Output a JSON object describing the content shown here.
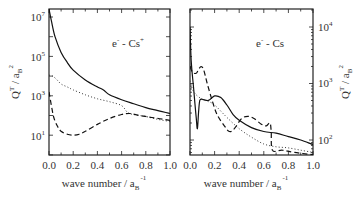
{
  "chart_data": [
    {
      "type": "line",
      "title": "e⁻ - Cs⁺",
      "annotation": "e- - Cs+",
      "xlabel": "wave number / a_B^-1",
      "ylabel": "Q^T / a_B^2",
      "yscale": "log",
      "xlim": [
        0.0,
        1.0
      ],
      "ylim": [
        1,
        25000000
      ],
      "x_ticks": [
        "0.0",
        "0.2",
        "0.4",
        "0.6",
        "0.8",
        "1.0"
      ],
      "y_ticks": [
        "10^1",
        "10^3",
        "10^5",
        "10^7"
      ],
      "y_axis_side": "left",
      "legend": "none",
      "series": [
        {
          "name": "solid",
          "style": "solid",
          "x": [
            0.0,
            0.02,
            0.05,
            0.1,
            0.15,
            0.2,
            0.3,
            0.4,
            0.45,
            0.5,
            0.6,
            0.7,
            0.8,
            0.9,
            1.0
          ],
          "log10_y": [
            7.4,
            6.8,
            6.0,
            5.2,
            4.7,
            4.3,
            3.8,
            3.45,
            3.3,
            3.05,
            2.8,
            2.6,
            2.4,
            2.25,
            2.1
          ]
        },
        {
          "name": "dotted",
          "style": "dotted",
          "x": [
            0.0,
            0.03,
            0.06,
            0.1,
            0.15,
            0.2,
            0.3,
            0.4,
            0.5,
            0.6,
            0.65,
            0.7,
            0.8,
            0.9,
            1.0
          ],
          "log10_y": [
            4.05,
            4.0,
            3.85,
            3.6,
            3.45,
            3.3,
            3.05,
            2.85,
            2.7,
            2.5,
            2.15,
            2.05,
            1.95,
            1.8,
            1.7
          ]
        },
        {
          "name": "dashed",
          "style": "dashed",
          "x": [
            0.0,
            0.02,
            0.04,
            0.07,
            0.1,
            0.15,
            0.2,
            0.25,
            0.3,
            0.4,
            0.5,
            0.6,
            0.67,
            0.75,
            0.85,
            1.0
          ],
          "log10_y": [
            3.2,
            2.5,
            1.9,
            1.45,
            1.2,
            1.05,
            1.0,
            1.05,
            1.2,
            1.55,
            1.85,
            2.05,
            2.1,
            2.0,
            1.9,
            1.75
          ]
        }
      ]
    },
    {
      "type": "line",
      "title": "e⁻ - Cs",
      "annotation": "e- - Cs",
      "xlabel": "wave number / a_B^-1",
      "ylabel": "Q^T / a_B^2",
      "yscale": "log",
      "xlim": [
        0.0,
        1.0
      ],
      "ylim": [
        55,
        20000
      ],
      "x_ticks": [
        "0.0",
        "0.2",
        "0.4",
        "0.6",
        "0.8",
        "1.0"
      ],
      "y_ticks": [
        "10^2",
        "10^3",
        "10^4"
      ],
      "y_axis_side": "right",
      "legend": "none",
      "series": [
        {
          "name": "solid",
          "style": "solid",
          "x": [
            0.0,
            0.01,
            0.03,
            0.05,
            0.06,
            0.07,
            0.08,
            0.1,
            0.15,
            0.2,
            0.25,
            0.3,
            0.35,
            0.4,
            0.5,
            0.6,
            0.7,
            0.8,
            0.9,
            1.0
          ],
          "log10_y": [
            4.0,
            3.4,
            2.9,
            2.4,
            2.2,
            2.5,
            2.7,
            2.72,
            2.7,
            2.78,
            2.75,
            2.62,
            2.45,
            2.35,
            2.22,
            2.15,
            2.12,
            2.06,
            2.0,
            1.92
          ]
        },
        {
          "name": "dotted",
          "style": "dotted",
          "x": [
            0.0,
            0.02,
            0.05,
            0.1,
            0.15,
            0.2,
            0.3,
            0.4,
            0.5,
            0.6,
            0.7,
            0.8,
            0.9,
            1.0
          ],
          "log10_y": [
            3.05,
            2.9,
            2.8,
            2.72,
            2.68,
            2.62,
            2.4,
            2.2,
            2.05,
            1.93,
            1.88,
            1.86,
            1.82,
            1.78
          ]
        },
        {
          "name": "dashed",
          "style": "dashed",
          "x": [
            0.0,
            0.02,
            0.05,
            0.07,
            0.09,
            0.11,
            0.14,
            0.18,
            0.22,
            0.28,
            0.32,
            0.36,
            0.42,
            0.47,
            0.52,
            0.58,
            0.62,
            0.65,
            0.66,
            0.67,
            0.75,
            0.85,
            1.0
          ],
          "log10_y": [
            3.3,
            3.2,
            3.18,
            3.25,
            3.3,
            3.25,
            3.0,
            2.7,
            2.45,
            2.25,
            2.15,
            2.2,
            2.38,
            2.42,
            2.38,
            2.28,
            2.25,
            2.3,
            2.15,
            1.82,
            1.82,
            1.78,
            1.74
          ]
        }
      ]
    }
  ],
  "panels": {
    "left": {
      "annotation_main": "e",
      "annotation_sup1": "-",
      "annotation_mid": " - Cs",
      "annotation_sup2": "+",
      "x_ticks": [
        "0.0",
        "0.2",
        "0.4",
        "0.6",
        "0.8",
        "1.0"
      ],
      "y_ticks": [
        {
          "base": "10",
          "exp": "7"
        },
        {
          "base": "10",
          "exp": "5"
        },
        {
          "base": "10",
          "exp": "3"
        },
        {
          "base": "10",
          "exp": "1"
        }
      ],
      "xlabel_main": "wave number  /  a",
      "xlabel_sub": "B",
      "xlabel_sup": "-1",
      "ylabel_main": "Q",
      "ylabel_sup": "T",
      "ylabel_mid": "  /  a",
      "ylabel_sub": "B",
      "ylabel_sup2": "2"
    },
    "right": {
      "annotation_main": "e",
      "annotation_sup1": "-",
      "annotation_mid": " - Cs",
      "x_ticks": [
        "0.0",
        "0.2",
        "0.4",
        "0.6",
        "0.8",
        "1.0"
      ],
      "y_ticks": [
        {
          "base": "10",
          "exp": "4"
        },
        {
          "base": "10",
          "exp": "3"
        },
        {
          "base": "10",
          "exp": "2"
        }
      ],
      "xlabel_main": "wave number  / a",
      "xlabel_sub": "B",
      "xlabel_sup": "-1",
      "ylabel_main": "Q",
      "ylabel_sup": "T",
      "ylabel_mid": "  /  a",
      "ylabel_sub": "B",
      "ylabel_sup2": "2"
    }
  }
}
